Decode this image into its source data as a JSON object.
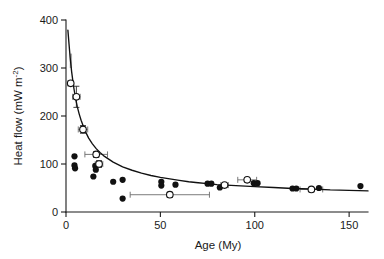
{
  "figure": {
    "background_color": "#ffffff",
    "ink_color": "#111111",
    "errorbar_color": "#6b6b6b"
  },
  "chart_data": {
    "type": "scatter",
    "title": "",
    "subtitle": "",
    "xlabel": "Age (My)",
    "ylabel": "Heat flow (mW m",
    "ylabel_exponent": "-2",
    "ylabel_tail": ")",
    "xlim": [
      0,
      160
    ],
    "ylim": [
      0,
      400
    ],
    "xticks": [
      0,
      50,
      100,
      150
    ],
    "xtick_labels": [
      "0",
      "50",
      "100",
      "150"
    ],
    "yticks": [
      0,
      100,
      200,
      300,
      400
    ],
    "ytick_labels": [
      "0",
      "100",
      "200",
      "300",
      "400"
    ],
    "grid": false,
    "legend": null,
    "legend_position": "none",
    "series": [
      {
        "name": "Mean heat flow (open circles)",
        "marker": "open-circle",
        "points": [
          {
            "x": 2.5,
            "y": 268,
            "xerr": 1.5,
            "yerr": 0
          },
          {
            "x": 5.5,
            "y": 240,
            "xerr": 2.0,
            "yerr": 22
          },
          {
            "x": 9.0,
            "y": 172,
            "xerr": 2.5,
            "yerr": 8
          },
          {
            "x": 16.0,
            "y": 120,
            "xerr": 6.0,
            "yerr": 6
          },
          {
            "x": 17.5,
            "y": 100,
            "xerr": 2.0,
            "yerr": 7
          },
          {
            "x": 55.0,
            "y": 36,
            "xerr": 21.0,
            "yerr": 5
          },
          {
            "x": 84.0,
            "y": 56,
            "xerr": 2.0,
            "yerr": 3
          },
          {
            "x": 96.0,
            "y": 67,
            "xerr": 5.0,
            "yerr": 3
          },
          {
            "x": 130.0,
            "y": 47,
            "xerr": 6.0,
            "yerr": 3
          }
        ]
      },
      {
        "name": "Individual measurements (filled circles)",
        "marker": "filled-circle",
        "points": [
          {
            "x": 4.5,
            "y": 116
          },
          {
            "x": 4.5,
            "y": 97
          },
          {
            "x": 4.8,
            "y": 91
          },
          {
            "x": 15.5,
            "y": 96
          },
          {
            "x": 15.8,
            "y": 88
          },
          {
            "x": 14.5,
            "y": 74
          },
          {
            "x": 25.0,
            "y": 63
          },
          {
            "x": 30.0,
            "y": 67
          },
          {
            "x": 30.0,
            "y": 28
          },
          {
            "x": 50.5,
            "y": 63
          },
          {
            "x": 50.5,
            "y": 55
          },
          {
            "x": 58.0,
            "y": 57
          },
          {
            "x": 75.0,
            "y": 59
          },
          {
            "x": 77.0,
            "y": 59
          },
          {
            "x": 81.5,
            "y": 51
          },
          {
            "x": 99.5,
            "y": 60
          },
          {
            "x": 101.5,
            "y": 60
          },
          {
            "x": 120.0,
            "y": 49
          },
          {
            "x": 122.0,
            "y": 49
          },
          {
            "x": 134.0,
            "y": 50
          },
          {
            "x": 156.0,
            "y": 54
          }
        ]
      }
    ],
    "fit_curve": {
      "name": "Theoretical cooling-plate heat flow curve",
      "points": [
        {
          "x": 1.0,
          "y": 379
        },
        {
          "x": 1.6,
          "y": 350
        },
        {
          "x": 2.2,
          "y": 322
        },
        {
          "x": 3.0,
          "y": 292
        },
        {
          "x": 4.0,
          "y": 262
        },
        {
          "x": 5.0,
          "y": 238
        },
        {
          "x": 6.0,
          "y": 219
        },
        {
          "x": 7.0,
          "y": 204
        },
        {
          "x": 8.0,
          "y": 191
        },
        {
          "x": 10.0,
          "y": 170
        },
        {
          "x": 12.0,
          "y": 154
        },
        {
          "x": 14.0,
          "y": 142
        },
        {
          "x": 16.0,
          "y": 132
        },
        {
          "x": 18.0,
          "y": 124
        },
        {
          "x": 20.0,
          "y": 117
        },
        {
          "x": 25.0,
          "y": 104
        },
        {
          "x": 30.0,
          "y": 94
        },
        {
          "x": 35.0,
          "y": 87
        },
        {
          "x": 40.0,
          "y": 81
        },
        {
          "x": 45.0,
          "y": 76
        },
        {
          "x": 50.0,
          "y": 72
        },
        {
          "x": 55.0,
          "y": 69
        },
        {
          "x": 60.0,
          "y": 66
        },
        {
          "x": 65.0,
          "y": 63
        },
        {
          "x": 70.0,
          "y": 61
        },
        {
          "x": 75.0,
          "y": 59
        },
        {
          "x": 80.0,
          "y": 57
        },
        {
          "x": 85.0,
          "y": 56
        },
        {
          "x": 90.0,
          "y": 55
        },
        {
          "x": 100.0,
          "y": 53
        },
        {
          "x": 110.0,
          "y": 51
        },
        {
          "x": 120.0,
          "y": 49
        },
        {
          "x": 130.0,
          "y": 48
        },
        {
          "x": 140.0,
          "y": 46
        },
        {
          "x": 150.0,
          "y": 45
        },
        {
          "x": 160.0,
          "y": 44
        }
      ]
    },
    "shaded_band": {
      "name": "uncertainty band near young ages",
      "x_range": [
        2.0,
        3.2
      ],
      "y_range": [
        300,
        330
      ]
    }
  }
}
